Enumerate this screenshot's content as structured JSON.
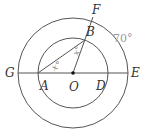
{
  "diagram": {
    "title": "",
    "center": {
      "name": "O",
      "x": 73,
      "y": 73
    },
    "circles": [
      {
        "id": "outer",
        "r": 55
      },
      {
        "id": "inner",
        "r": 35
      }
    ],
    "points": {
      "G": {
        "label": "G",
        "x": 18,
        "y": 73
      },
      "A": {
        "label": "A",
        "x": 38,
        "y": 73
      },
      "O": {
        "label": "O",
        "x": 73,
        "y": 73
      },
      "D": {
        "label": "D",
        "x": 108,
        "y": 73
      },
      "E": {
        "label": "E",
        "x": 128,
        "y": 73
      },
      "B": {
        "label": "B",
        "x": 85,
        "y": 40
      },
      "F": {
        "label": "F",
        "x": 92,
        "y": 21
      }
    },
    "segments": [
      "G-E",
      "A-B",
      "O-F"
    ],
    "angle_labels": [
      {
        "text": "x°",
        "at": "A",
        "desc": "angle BAO"
      },
      {
        "text": "x°",
        "at": "B",
        "desc": "angle ABO"
      }
    ],
    "arc_label": {
      "text": "70°",
      "desc": "arc EF on outer circle"
    },
    "colors": {
      "stroke": "#555555",
      "label": "#333333",
      "muted_label": "#9a9a9a"
    }
  }
}
